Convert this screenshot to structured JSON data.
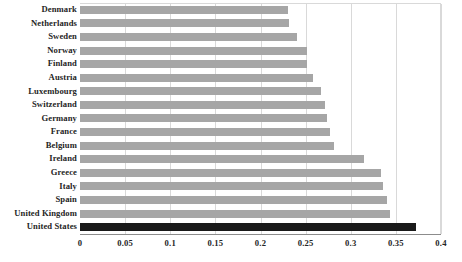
{
  "chart_data": {
    "type": "bar",
    "orientation": "horizontal",
    "title": "",
    "subtitle": "",
    "xlabel": "",
    "ylabel": "",
    "xlim": [
      0,
      0.4
    ],
    "ylim": null,
    "grid": true,
    "legend": null,
    "xticks": [
      "0",
      "0.05",
      "0.1",
      "0.15",
      "0.2",
      "0.25",
      "0.3",
      "0.35",
      "0.4"
    ],
    "xtick_values": [
      0,
      0.05,
      0.1,
      0.15,
      0.2,
      0.25,
      0.3,
      0.35,
      0.4
    ],
    "categories": [
      "Denmark",
      "Netherlands",
      "Sweden",
      "Norway",
      "Finland",
      "Austria",
      "Luxembourg",
      "Switzerland",
      "Germany",
      "France",
      "Belgium",
      "Ireland",
      "Greece",
      "Italy",
      "Spain",
      "United Kingdom",
      "United States"
    ],
    "values": [
      0.23,
      0.232,
      0.24,
      0.251,
      0.252,
      0.258,
      0.267,
      0.271,
      0.274,
      0.277,
      0.281,
      0.315,
      0.334,
      0.336,
      0.34,
      0.343,
      0.372
    ],
    "highlight_category": "United States",
    "colors": {
      "bar": "#a6a6a6",
      "bar_highlight": "#1a1a1a",
      "gridline": "#d9d9d9",
      "axis": "#8c8c8c",
      "text": "#252525",
      "background": "#ffffff"
    }
  }
}
